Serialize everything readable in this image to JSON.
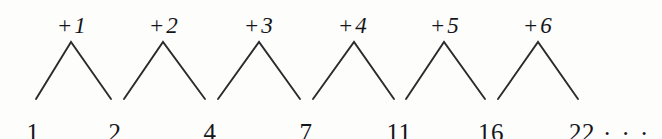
{
  "figure": {
    "background_color": "#fdfdfc",
    "stroke_color": "#2b2b2e",
    "text_color": "#15161a"
  },
  "chart_data": {
    "type": "line",
    "xlabel": "",
    "ylabel": "",
    "categories": [
      "1",
      "2",
      "3",
      "4",
      "5",
      "6",
      "7"
    ],
    "values": [
      1,
      2,
      4,
      7,
      11,
      16,
      22
    ],
    "annotations": [
      "+1",
      "+2",
      "+3",
      "+4",
      "+5",
      "+6"
    ],
    "trailing": "...",
    "grid": false,
    "legend": null
  },
  "terms": [
    {
      "label": "1",
      "x": 33,
      "y": 120
    },
    {
      "label": "2",
      "x": 115,
      "y": 120
    },
    {
      "label": "4",
      "x": 210,
      "y": 120
    },
    {
      "label": "7",
      "x": 306,
      "y": 120
    },
    {
      "label": "11",
      "x": 399,
      "y": 120
    },
    {
      "label": "16",
      "x": 491,
      "y": 120
    },
    {
      "label": "22",
      "x": 582,
      "y": 120
    }
  ],
  "steps": [
    {
      "plus": "+",
      "amount": "1",
      "x": 72,
      "y": 14
    },
    {
      "plus": "+",
      "amount": "2",
      "x": 164,
      "y": 14
    },
    {
      "plus": "+",
      "amount": "3",
      "x": 259,
      "y": 14
    },
    {
      "plus": "+",
      "amount": "4",
      "x": 353,
      "y": 14
    },
    {
      "plus": "+",
      "amount": "5",
      "x": 445,
      "y": 14
    },
    {
      "plus": "+",
      "amount": "6",
      "x": 538,
      "y": 14
    }
  ],
  "ellipsis": {
    "text": ". . .",
    "x": 604,
    "y": 114
  },
  "chevrons": [
    {
      "from_x": 36,
      "peak_x": 71,
      "to_x": 111
    },
    {
      "from_x": 124,
      "peak_x": 163,
      "to_x": 205
    },
    {
      "from_x": 218,
      "peak_x": 259,
      "to_x": 300
    },
    {
      "from_x": 313,
      "peak_x": 354,
      "to_x": 394
    },
    {
      "from_x": 406,
      "peak_x": 444,
      "to_x": 485
    },
    {
      "from_x": 498,
      "peak_x": 538,
      "to_x": 578
    }
  ],
  "geometry": {
    "peak_y": 42,
    "base_y": 99
  }
}
